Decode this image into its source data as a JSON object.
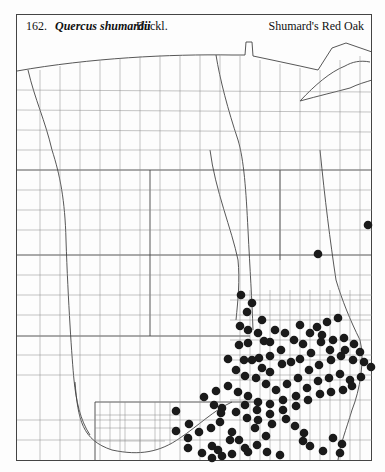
{
  "header": {
    "number": "162.",
    "scientific_name": "Quercus shumardii",
    "authority": "Buckl.",
    "common_name": "Shumard's Red Oak"
  },
  "map": {
    "description": "County outline map of the central United States (Great Plains and Midwest) with dots marking counties where the species occurs",
    "symbol": "filled-circle",
    "symbol_color": "#1a1a1a",
    "line_color": "#555555",
    "occurrence_dots": [
      [
        368,
        225
      ],
      [
        318,
        254
      ],
      [
        241,
        295
      ],
      [
        252,
        303
      ],
      [
        247,
        312
      ],
      [
        240,
        326
      ],
      [
        248,
        330
      ],
      [
        258,
        333
      ],
      [
        264,
        341
      ],
      [
        270,
        342
      ],
      [
        239,
        345
      ],
      [
        248,
        343
      ],
      [
        259,
        358
      ],
      [
        270,
        356
      ],
      [
        281,
        350
      ],
      [
        294,
        340
      ],
      [
        303,
        344
      ],
      [
        317,
        327
      ],
      [
        327,
        322
      ],
      [
        338,
        318
      ],
      [
        252,
        360
      ],
      [
        244,
        360
      ],
      [
        262,
        368
      ],
      [
        270,
        372
      ],
      [
        282,
        364
      ],
      [
        291,
        362
      ],
      [
        300,
        359
      ],
      [
        311,
        353
      ],
      [
        321,
        342
      ],
      [
        333,
        340
      ],
      [
        344,
        338
      ],
      [
        354,
        344
      ],
      [
        360,
        352
      ],
      [
        245,
        376
      ],
      [
        256,
        378
      ],
      [
        266,
        384
      ],
      [
        276,
        390
      ],
      [
        287,
        384
      ],
      [
        298,
        378
      ],
      [
        309,
        370
      ],
      [
        319,
        365
      ],
      [
        331,
        360
      ],
      [
        341,
        356
      ],
      [
        353,
        360
      ],
      [
        364,
        362
      ],
      [
        371,
        367
      ],
      [
        228,
        359
      ],
      [
        236,
        370
      ],
      [
        228,
        386
      ],
      [
        238,
        392
      ],
      [
        248,
        396
      ],
      [
        258,
        402
      ],
      [
        270,
        404
      ],
      [
        283,
        400
      ],
      [
        296,
        396
      ],
      [
        307,
        388
      ],
      [
        318,
        381
      ],
      [
        329,
        378
      ],
      [
        340,
        374
      ],
      [
        350,
        380
      ],
      [
        361,
        377
      ],
      [
        216,
        391
      ],
      [
        222,
        408
      ],
      [
        236,
        412
      ],
      [
        247,
        418
      ],
      [
        258,
        420
      ],
      [
        270,
        414
      ],
      [
        283,
        410
      ],
      [
        296,
        406
      ],
      [
        308,
        400
      ],
      [
        320,
        394
      ],
      [
        331,
        392
      ],
      [
        343,
        390
      ],
      [
        352,
        386
      ],
      [
        322,
        335
      ],
      [
        300,
        325
      ],
      [
        310,
        333
      ],
      [
        285,
        333
      ],
      [
        275,
        330
      ],
      [
        262,
        320
      ],
      [
        330,
        350
      ],
      [
        345,
        350
      ],
      [
        204,
        397
      ],
      [
        214,
        405
      ],
      [
        221,
        413
      ],
      [
        245,
        405
      ],
      [
        257,
        410
      ],
      [
        272,
        424
      ],
      [
        266,
        436
      ],
      [
        257,
        445
      ],
      [
        245,
        448
      ],
      [
        239,
        440
      ],
      [
        232,
        432
      ],
      [
        176,
        411
      ],
      [
        189,
        424
      ],
      [
        176,
        431
      ],
      [
        188,
        438
      ],
      [
        199,
        432
      ],
      [
        211,
        428
      ],
      [
        220,
        422
      ],
      [
        212,
        446
      ],
      [
        218,
        450
      ],
      [
        222,
        456
      ],
      [
        232,
        454
      ],
      [
        248,
        452
      ],
      [
        286,
        419
      ],
      [
        295,
        426
      ],
      [
        304,
        433
      ],
      [
        303,
        441
      ],
      [
        310,
        446
      ],
      [
        333,
        438
      ],
      [
        342,
        444
      ],
      [
        340,
        453
      ],
      [
        323,
        451
      ],
      [
        230,
        440
      ],
      [
        188,
        448
      ],
      [
        202,
        453
      ],
      [
        212,
        458
      ],
      [
        255,
        428
      ],
      [
        267,
        452
      ],
      [
        280,
        455
      ]
    ]
  }
}
